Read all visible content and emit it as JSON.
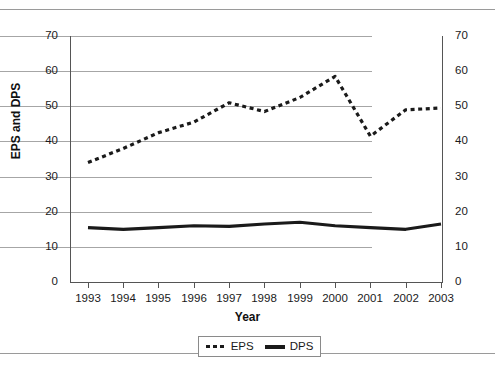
{
  "chart_data": {
    "type": "line",
    "title": "",
    "xlabel": "Year",
    "ylabel": "EPS and DPS",
    "categories": [
      "1993",
      "1994",
      "1995",
      "1996",
      "1997",
      "1998",
      "1999",
      "2000",
      "2001",
      "2002",
      "2003"
    ],
    "series": [
      {
        "name": "EPS",
        "style": "dotted",
        "color": "#1a1a1a",
        "values": [
          34,
          38,
          42.5,
          45.5,
          51,
          48.5,
          52.5,
          58.5,
          41.5,
          49,
          49.5
        ]
      },
      {
        "name": "DPS",
        "style": "solid",
        "color": "#1a1a1a",
        "values": [
          15.5,
          15,
          15.5,
          16,
          15.8,
          16.5,
          17,
          16,
          15.5,
          15,
          16.5
        ]
      }
    ],
    "ylim": [
      0,
      70
    ],
    "yticks": [
      0,
      10,
      20,
      30,
      40,
      50,
      60,
      70
    ],
    "ytick_labels_left": [
      "0",
      "10",
      "20",
      "30",
      "40",
      "50",
      "60",
      "70"
    ],
    "ytick_labels_right": [
      "0",
      "10",
      "20",
      "30",
      "40",
      "50",
      "60",
      "70"
    ],
    "grid": true,
    "grid_axis": "y",
    "legend_position": "bottom",
    "legend_entries": [
      "EPS",
      "DPS"
    ],
    "secondary_yaxis": true
  },
  "figure": {
    "axis_title_y": "EPS and DPS",
    "axis_title_x": "Year"
  },
  "legend": {
    "items": [
      {
        "label": "EPS",
        "marker": "dotted-line-swatch"
      },
      {
        "label": "DPS",
        "marker": "solid-line-swatch"
      }
    ]
  }
}
